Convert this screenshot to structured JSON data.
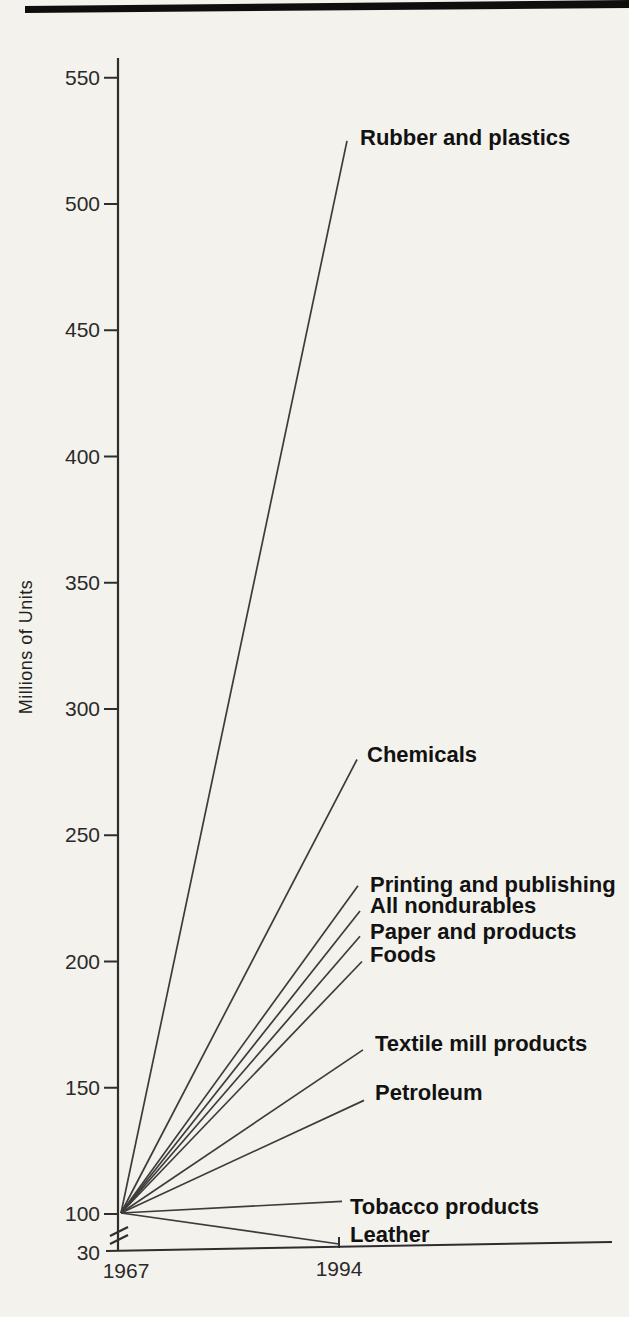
{
  "colors": {
    "background": "#f4f2ed",
    "top_rule": "#0e0e0e",
    "axis_ink": "#2e2e2e",
    "line_ink": "#3c3c3c",
    "text_ink": "#141414"
  },
  "chart_data": {
    "type": "line",
    "title": "",
    "subtitle": "",
    "ylabel": "Millions of Units",
    "xlabel": "",
    "x_categories": [
      "1967",
      "1994"
    ],
    "yticks": [
      550,
      500,
      450,
      400,
      350,
      300,
      250,
      200,
      150,
      100,
      30
    ],
    "ylim": [
      30,
      560
    ],
    "axis_break_below_value": 100,
    "base_index_value": 100,
    "grid": false,
    "legend_position": "inline-end-labels",
    "series": [
      {
        "name": "Rubber and plastics",
        "values": [
          100,
          525
        ]
      },
      {
        "name": "Chemicals",
        "values": [
          100,
          280
        ]
      },
      {
        "name": "Printing and publishing",
        "values": [
          100,
          230
        ]
      },
      {
        "name": "All nondurables",
        "values": [
          100,
          220
        ]
      },
      {
        "name": "Paper and products",
        "values": [
          100,
          210
        ]
      },
      {
        "name": "Foods",
        "values": [
          100,
          200
        ]
      },
      {
        "name": "Textile mill products",
        "values": [
          100,
          165
        ]
      },
      {
        "name": "Petroleum",
        "values": [
          100,
          145
        ]
      },
      {
        "name": "Tobacco products",
        "values": [
          100,
          105
        ]
      },
      {
        "name": "Leather",
        "values": [
          100,
          40
        ]
      }
    ]
  }
}
